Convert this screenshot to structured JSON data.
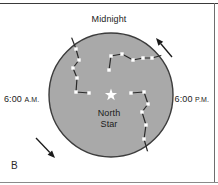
{
  "figure": {
    "panel_label": "B",
    "background_color": "#ffffff",
    "frame_color": "#4a4a4a"
  },
  "labels": {
    "midnight": "Midnight",
    "morning_time": "6:00",
    "morning_meridiem": "A.M.",
    "evening_time": "6:00",
    "evening_meridiem": "P.M.",
    "center_line1": "North",
    "center_line2": "Star"
  },
  "sky": {
    "fill_color": "#a9a9a9",
    "edge_color": "#3c3c3c",
    "center_x": 111,
    "center_y": 95,
    "radius": 62,
    "star_color": "#ffffff",
    "constellation_line_color": "#2b2b2b",
    "constellation_star_color": "#ffffff"
  },
  "rotation": {
    "direction": "counterclockwise",
    "arrow_color": "#1a1a1a",
    "arrows": [
      {
        "name": "upper-right-rotation-arrow",
        "from_x": 172,
        "from_y": 57,
        "to_x": 156,
        "to_y": 38
      },
      {
        "name": "lower-left-rotation-arrow",
        "from_x": 36,
        "from_y": 138,
        "to_x": 55,
        "to_y": 158
      }
    ]
  },
  "chart_data": {
    "type": "scatter",
    "title": "Midnight",
    "xlabel": "",
    "ylabel": "",
    "constellations": [
      {
        "name": "upper-right-constellation",
        "points": [
          [
            109,
            70
          ],
          [
            111,
            56
          ],
          [
            122,
            54
          ],
          [
            133,
            60
          ],
          [
            143,
            58
          ],
          [
            152,
            58
          ],
          [
            163,
            55
          ]
        ]
      },
      {
        "name": "left-constellation",
        "points": [
          [
            71,
            36
          ],
          [
            76,
            49
          ],
          [
            79,
            60
          ],
          [
            73,
            68
          ],
          [
            77,
            78
          ],
          [
            76,
            92
          ],
          [
            89,
            93
          ]
        ]
      },
      {
        "name": "lower-right-constellation",
        "points": [
          [
            131,
            93
          ],
          [
            144,
            92
          ],
          [
            148,
            104
          ],
          [
            142,
            112
          ],
          [
            146,
            125
          ],
          [
            144,
            139
          ],
          [
            148,
            153
          ]
        ]
      }
    ],
    "pole_star": {
      "x": 111,
      "y": 95,
      "label": "North Star"
    }
  }
}
